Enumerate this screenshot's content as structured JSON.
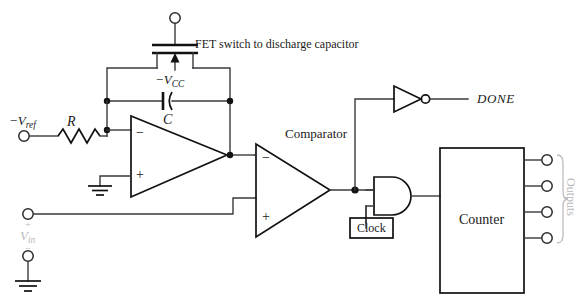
{
  "figure": {
    "kind": "circuit-schematic",
    "title_visible": false,
    "colors": {
      "wire": "#3a3a3f",
      "device_outline": "#111111",
      "text": "#1a1a1a",
      "faint_text": "#b9b9bd",
      "background": "#ffffff"
    }
  },
  "labels": {
    "fet_note": "FET switch to discharge capacitor",
    "vcc_minus_prefix": "−V",
    "vcc_minus_sub": "CC",
    "vref_prefix": "−V",
    "vref_sub": "ref",
    "resistor": "R",
    "capacitor": "C",
    "vin_prefix": "V",
    "vin_sub": "in",
    "comparator": "Comparator",
    "done": "DONE",
    "clock": "Clock",
    "counter": "Counter",
    "outputs": "Outputs",
    "opamp_inverting": "−",
    "opamp_noninverting": "+",
    "comparator_inverting": "−",
    "comparator_noninverting": "+",
    "vin_terminal_plus": "+",
    "vin_terminal_minus": "−"
  },
  "blocks": [
    {
      "name": "integrator-opamp",
      "type": "op-amp",
      "inputs": [
        "−",
        "+"
      ]
    },
    {
      "name": "comparator",
      "type": "op-amp",
      "label": "Comparator",
      "inputs": [
        "−",
        "+"
      ]
    },
    {
      "name": "and-gate",
      "type": "and",
      "inputs": 2,
      "outputs": 1
    },
    {
      "name": "inverter",
      "type": "not",
      "inputs": 1,
      "outputs": 1,
      "output_label": "DONE"
    },
    {
      "name": "counter",
      "type": "block",
      "label": "Counter",
      "outputs": 4
    },
    {
      "name": "clock-source",
      "type": "block",
      "label": "Clock"
    },
    {
      "name": "fet-switch",
      "type": "mosfet",
      "note": "FET switch to discharge capacitor"
    }
  ],
  "terminals": [
    {
      "name": "fet-drain-terminal",
      "label": ""
    },
    {
      "name": "vref-terminal",
      "label": "−Vref"
    },
    {
      "name": "vin-plus-terminal",
      "label": "+"
    },
    {
      "name": "vin-minus-terminal",
      "label": "−"
    },
    {
      "name": "output-terminal-1",
      "label": ""
    },
    {
      "name": "output-terminal-2",
      "label": ""
    },
    {
      "name": "output-terminal-3",
      "label": ""
    },
    {
      "name": "output-terminal-4",
      "label": ""
    }
  ]
}
